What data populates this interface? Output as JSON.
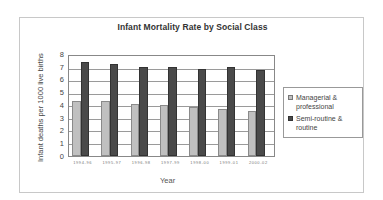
{
  "chart_data": {
    "type": "bar",
    "title": "Infant Mortality Rate by Social Class",
    "xlabel": "Year",
    "ylabel": "Infant deaths per 1000 live births",
    "categories": [
      "1994-96",
      "1995-97",
      "1996-98",
      "1997-99",
      "1998-00",
      "1999-01",
      "2000-02"
    ],
    "series": [
      {
        "name": "Managerial & professional",
        "color": "#c0c0c0",
        "values": [
          4.4,
          4.4,
          4.2,
          4.1,
          3.9,
          3.8,
          3.6
        ]
      },
      {
        "name": "Semi-routine & routine",
        "color": "#4a4a4a",
        "values": [
          7.5,
          7.4,
          7.1,
          7.1,
          7.0,
          7.1,
          6.9
        ]
      }
    ],
    "ylim": [
      0,
      8
    ],
    "yticks": [
      "0",
      "1",
      "2",
      "3",
      "4",
      "5",
      "6",
      "7",
      "8"
    ],
    "grid": true,
    "legend_position": "right"
  },
  "legend": {
    "item1_line1": "Managerial &",
    "item1_line2": "professional",
    "item2_line1": "Semi-routine &",
    "item2_line2": "routine"
  }
}
